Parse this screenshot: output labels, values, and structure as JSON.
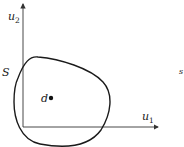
{
  "diagram": {
    "type": "set-in-plane",
    "axes": {
      "x_label": "u",
      "x_sub": "1",
      "y_label": "u",
      "y_sub": "2"
    },
    "set_label": "S",
    "point_label": "d",
    "edge_mark": "s",
    "colors": {
      "axis": "#333333",
      "curve": "#1a1a1a",
      "text": "#222222",
      "background": "#ffffff"
    }
  }
}
